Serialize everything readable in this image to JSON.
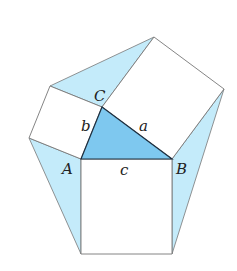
{
  "diagram": {
    "colors": {
      "background": "#ffffff",
      "central_triangle_fill": "#7ec8ef",
      "flank_triangle_fill": "#c4ebfa",
      "square_fill": "#ffffff",
      "stroke": "#777777",
      "triangle_stroke": "#1f3040"
    },
    "vertices": {
      "A": {
        "label": "A",
        "x": 81,
        "y": 159
      },
      "B": {
        "label": "B",
        "x": 172,
        "y": 159
      },
      "C": {
        "label": "C",
        "x": 102,
        "y": 107
      }
    },
    "sides": {
      "a": {
        "label": "a"
      },
      "b": {
        "label": "b"
      },
      "c": {
        "label": "c"
      }
    },
    "squares": {
      "on_c": [
        [
          81,
          159
        ],
        [
          172,
          159
        ],
        [
          172,
          254
        ],
        [
          81,
          254
        ]
      ],
      "on_b": [
        [
          81,
          159
        ],
        [
          102,
          107
        ],
        [
          50,
          86
        ],
        [
          29,
          138
        ]
      ],
      "on_a": [
        [
          102,
          107
        ],
        [
          172,
          159
        ],
        [
          224,
          89
        ],
        [
          154,
          37
        ]
      ]
    },
    "flank_triangles": {
      "top": [
        [
          50,
          86
        ],
        [
          102,
          107
        ],
        [
          154,
          37
        ]
      ],
      "left": [
        [
          29,
          138
        ],
        [
          81,
          159
        ],
        [
          81,
          254
        ]
      ],
      "right": [
        [
          224,
          89
        ],
        [
          172,
          159
        ],
        [
          172,
          254
        ]
      ]
    }
  }
}
